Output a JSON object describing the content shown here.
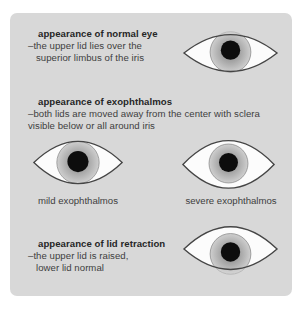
{
  "colors": {
    "page_background": "#ffffff",
    "card_background": "#d8d8d8",
    "heading_text": "#262626",
    "body_text": "#3e3e3e",
    "eye_outline": "#454545",
    "sclera": "#fcfcfc",
    "iris_inner": "#8f8f8f",
    "iris_mid": "#a3a3a3",
    "iris_outer": "#cfcfcf",
    "iris_rim": "#8a8a8a",
    "pupil": "#0d0d0d"
  },
  "sections": [
    {
      "heading": "appearance of normal eye",
      "lines": [
        "–the upper lid lies over the",
        "superior limbus of the iris"
      ],
      "eye_name": "normal-eye"
    },
    {
      "heading": "appearance of exophthalmos",
      "lines": [
        "–both lids are moved away from the center with sclera",
        "visible below or all around iris"
      ],
      "eyes": [
        {
          "name": "mild-exophthalmos-eye",
          "label": "mild exophthalmos"
        },
        {
          "name": "severe-exophthalmos-eye",
          "label": "severe exophthalmos"
        }
      ]
    },
    {
      "heading": "appearance of lid retraction",
      "lines": [
        "–the upper lid is raised,",
        "lower lid normal"
      ],
      "eye_name": "lid-retraction-eye"
    }
  ]
}
